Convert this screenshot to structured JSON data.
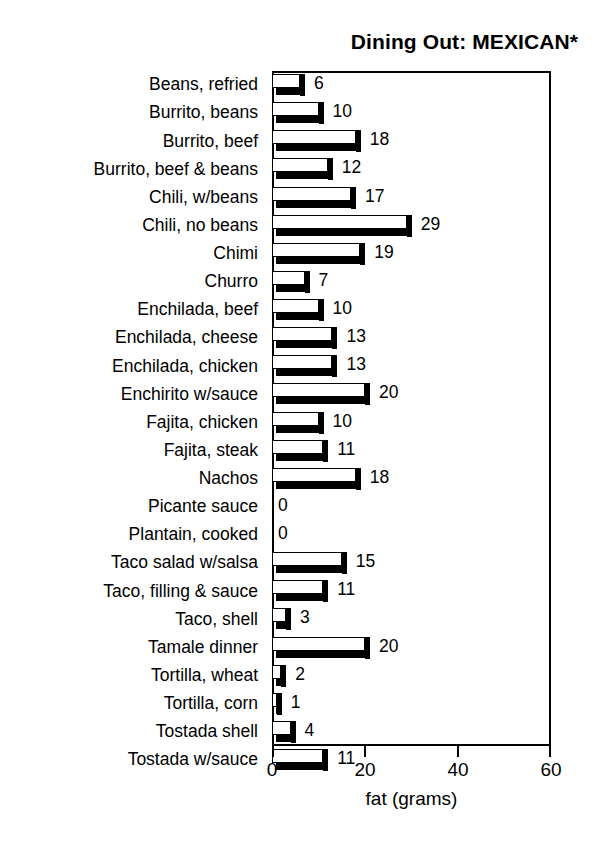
{
  "chart_data": {
    "type": "bar",
    "orientation": "horizontal",
    "title": "Dining Out: MEXICAN*",
    "xlabel": "fat (grams)",
    "ylabel": "",
    "xlim": [
      0,
      60
    ],
    "xticks": [
      0,
      20,
      40,
      60
    ],
    "xtick_labels": [
      "0",
      "20",
      "40",
      "60"
    ],
    "grid": false,
    "legend": null,
    "style": "3d-bar",
    "categories": [
      "Beans, refried",
      "Burrito, beans",
      "Burrito, beef",
      "Burrito, beef & beans",
      "Chili, w/beans",
      "Chili, no beans",
      "Chimi",
      "Churro",
      "Enchilada, beef",
      "Enchilada, cheese",
      "Enchilada, chicken",
      "Enchirito w/sauce",
      "Fajita, chicken",
      "Fajita, steak",
      "Nachos",
      "Picante sauce",
      "Plantain, cooked",
      "Taco salad w/salsa",
      "Taco, filling & sauce",
      "Taco, shell",
      "Tamale dinner",
      "Tortilla, wheat",
      "Tortilla, corn",
      "Tostada shell",
      "Tostada w/sauce"
    ],
    "values": [
      6,
      10,
      18,
      12,
      17,
      29,
      19,
      7,
      10,
      13,
      13,
      20,
      10,
      11,
      18,
      0,
      0,
      15,
      11,
      3,
      20,
      2,
      1,
      4,
      11
    ],
    "value_labels": [
      "6",
      "10",
      "18",
      "12",
      "17",
      "29",
      "19",
      "7",
      "10",
      "13",
      "13",
      "20",
      "10",
      "11",
      "18",
      "0",
      "0",
      "15",
      "11",
      "3",
      "20",
      "2",
      "1",
      "4",
      "11"
    ]
  },
  "colors": {
    "bar_face": "#ffffff",
    "bar_outline": "#000000",
    "bar_shadow": "#000000",
    "background": "#ffffff",
    "text": "#000000"
  }
}
